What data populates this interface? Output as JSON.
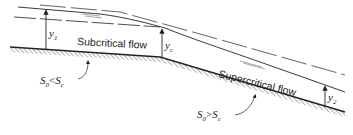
{
  "diagram": {
    "type": "open-channel flow profile (change of slope)",
    "regions": [
      {
        "label": "Subcritical flow",
        "condition_base": "S",
        "condition_sub": "0",
        "condition_op": "<",
        "condition_rhs": "S",
        "condition_rhs_sub": "c"
      },
      {
        "label": "Supercritical flow",
        "condition_base": "S",
        "condition_sub": "0",
        "condition_op": ">",
        "condition_rhs": "S",
        "condition_rhs_sub": "c"
      }
    ],
    "depths": [
      {
        "id": "y1",
        "base": "y",
        "sub": "1"
      },
      {
        "id": "yc",
        "base": "y",
        "sub": "c"
      },
      {
        "id": "y2",
        "base": "y",
        "sub": "2"
      }
    ],
    "colors": {
      "line": "#222222",
      "background": "#ffffff"
    }
  }
}
